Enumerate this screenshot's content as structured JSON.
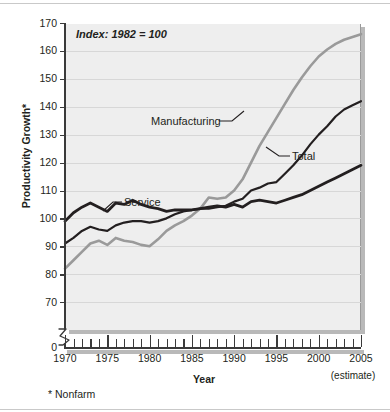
{
  "annotation": {
    "index_note": "Index: 1982 = 100",
    "footnote": "* Nonfarm",
    "estimate_note": "(estimate)"
  },
  "chart_data": {
    "type": "line",
    "title": "",
    "xlabel": "Year",
    "ylabel": "Productivity Growth*",
    "xlim": [
      1970,
      2005
    ],
    "ylim": [
      60,
      170
    ],
    "y_axis_break_below": 60,
    "y_zero_shown": true,
    "yticks": [
      170,
      160,
      150,
      140,
      130,
      120,
      110,
      100,
      90,
      80,
      70,
      0
    ],
    "xticks_major": [
      1970,
      1975,
      1980,
      1985,
      1990,
      1995,
      2000,
      2005
    ],
    "xtick_minor_step": 1,
    "grid": "horizontal",
    "legend_position": "inline-labels",
    "x": [
      1970,
      1971,
      1972,
      1973,
      1974,
      1975,
      1976,
      1977,
      1978,
      1979,
      1980,
      1981,
      1982,
      1983,
      1984,
      1985,
      1986,
      1987,
      1988,
      1989,
      1990,
      1991,
      1992,
      1993,
      1994,
      1995,
      1996,
      1997,
      1998,
      1999,
      2000,
      2001,
      2002,
      2003,
      2004,
      2005
    ],
    "series": [
      {
        "name": "Manufacturing",
        "color": "#9a9a9a",
        "width": 2.6,
        "values": [
          82,
          85,
          88,
          91,
          92,
          90.5,
          93,
          92,
          91.5,
          90.5,
          90,
          92.5,
          95.5,
          97.5,
          99,
          101,
          103.5,
          107.5,
          107,
          107.5,
          110,
          114,
          120,
          126,
          131,
          136,
          141,
          146,
          150.5,
          154.5,
          158,
          160.5,
          162.5,
          164,
          165,
          166
        ]
      },
      {
        "name": "Total",
        "color": "#231f20",
        "width": 2.2,
        "values": [
          91,
          93,
          95.5,
          97,
          96,
          95.5,
          97.5,
          98.5,
          99,
          99,
          98.5,
          99,
          100,
          101.5,
          102.5,
          103,
          103.5,
          103.5,
          104,
          104.5,
          106,
          107,
          110,
          111,
          112.5,
          113,
          116,
          119,
          122.5,
          126.5,
          130,
          133,
          136.5,
          139,
          140.5,
          142
        ]
      },
      {
        "name": "Service",
        "color": "#231f20",
        "width": 2.8,
        "values": [
          99,
          102,
          104,
          105.5,
          104,
          102.5,
          105.5,
          105,
          106.5,
          105,
          104,
          103.5,
          102.5,
          103,
          103,
          103,
          103.5,
          104,
          104.5,
          104,
          105,
          104,
          106,
          106.5,
          106,
          105.5,
          106.5,
          107.5,
          108.5,
          110,
          111.5,
          113,
          114.5,
          116,
          117.5,
          119
        ]
      }
    ]
  },
  "axis": {
    "x_labels": [
      "1970",
      "1975",
      "1980",
      "1985",
      "1990",
      "1995",
      "2000",
      "2005"
    ],
    "y_labels": [
      "170",
      "160",
      "150",
      "140",
      "130",
      "120",
      "110",
      "100",
      "90",
      "80",
      "70",
      "0"
    ]
  },
  "series_labels": {
    "manufacturing": "Manufacturing",
    "total": "Total",
    "service": "Service"
  }
}
